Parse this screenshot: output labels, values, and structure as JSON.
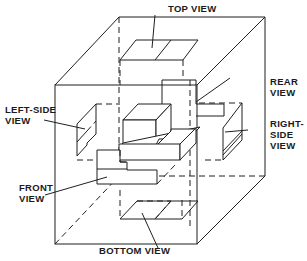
{
  "figure": {
    "type": "orthographic projection glass box",
    "labels": {
      "top_view": "TOP VIEW",
      "rear_view": "REAR\nVIEW",
      "left_side_view": "LEFT-SIDE\nVIEW",
      "right_side_view": "RIGHT-\nSIDE\nVIEW",
      "front_view": "FRONT\nVIEW",
      "bottom_view": "BOTTOM VIEW"
    },
    "colors": {
      "line": "#1f1f1f",
      "background": "#ffffff"
    }
  }
}
